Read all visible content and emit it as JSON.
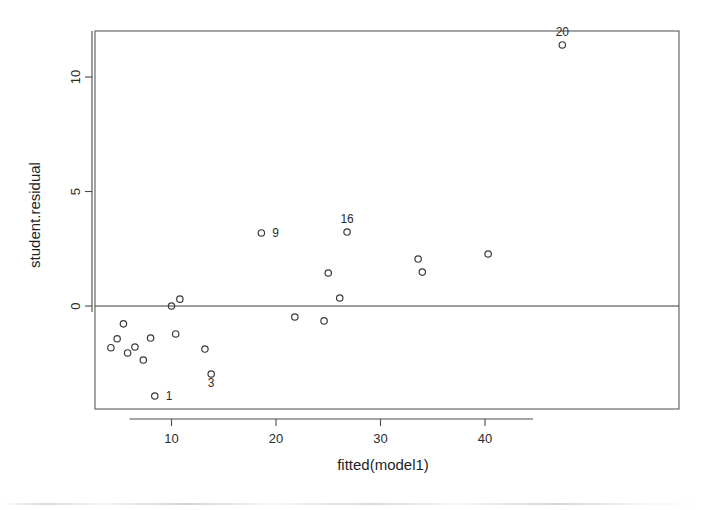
{
  "chart_data": {
    "type": "scatter",
    "title": "",
    "xlabel": "fitted(model1)",
    "ylabel": "student.residual",
    "xlim": [
      2.6,
      49.0
    ],
    "ylim": [
      -4.3,
      12.0
    ],
    "xticks": [
      10,
      20,
      30,
      40
    ],
    "xtick_labels": [
      "10",
      "20",
      "30",
      "40"
    ],
    "yticks": [
      0,
      5,
      10
    ],
    "ytick_labels": [
      "0",
      "5",
      "10"
    ],
    "grid": false,
    "legend": "none",
    "reference_lines": [
      {
        "name": "zero-residual-line",
        "orientation": "horizontal",
        "y": 0
      }
    ],
    "marker": "open-circle",
    "points": [
      {
        "x": 4.2,
        "y": -1.82,
        "label": ""
      },
      {
        "x": 4.8,
        "y": -1.43,
        "label": ""
      },
      {
        "x": 5.4,
        "y": -0.78,
        "label": ""
      },
      {
        "x": 5.8,
        "y": -2.05,
        "label": ""
      },
      {
        "x": 6.5,
        "y": -1.79,
        "label": ""
      },
      {
        "x": 7.3,
        "y": -2.36,
        "label": ""
      },
      {
        "x": 8.0,
        "y": -1.4,
        "label": ""
      },
      {
        "x": 8.4,
        "y": -3.93,
        "label": "1"
      },
      {
        "x": 10.0,
        "y": 0.0,
        "label": ""
      },
      {
        "x": 10.8,
        "y": 0.3,
        "label": ""
      },
      {
        "x": 10.4,
        "y": -1.22,
        "label": ""
      },
      {
        "x": 13.2,
        "y": -1.88,
        "label": ""
      },
      {
        "x": 13.8,
        "y": -2.97,
        "label": "3"
      },
      {
        "x": 18.6,
        "y": 3.19,
        "label": "9"
      },
      {
        "x": 21.8,
        "y": -0.48,
        "label": ""
      },
      {
        "x": 24.6,
        "y": -0.65,
        "label": ""
      },
      {
        "x": 25.0,
        "y": 1.44,
        "label": ""
      },
      {
        "x": 26.1,
        "y": 0.35,
        "label": ""
      },
      {
        "x": 26.8,
        "y": 3.23,
        "label": "16"
      },
      {
        "x": 33.6,
        "y": 2.05,
        "label": ""
      },
      {
        "x": 34.0,
        "y": 1.48,
        "label": ""
      },
      {
        "x": 40.3,
        "y": 2.27,
        "label": ""
      },
      {
        "x": 47.4,
        "y": 11.4,
        "label": "20"
      }
    ],
    "labeled_points": [
      "1",
      "3",
      "9",
      "16",
      "20"
    ]
  },
  "colors": {
    "background": "#ffffff",
    "axis": "#4a4a4a",
    "marker_stroke": "#3a3a3a",
    "text": "#1f1f1f"
  }
}
